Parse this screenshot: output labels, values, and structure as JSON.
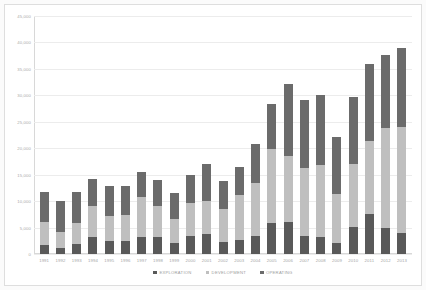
{
  "chart_data": {
    "type": "bar",
    "stacked": true,
    "title": "",
    "subtitle": "",
    "xlabel": "",
    "ylabel": "",
    "ylim": [
      0,
      45000
    ],
    "ytick_step": 5000,
    "ytick_labels": [
      "45,000",
      "40,000",
      "35,000",
      "30,000",
      "25,000",
      "20,000",
      "15,000",
      "10,000",
      "5,000",
      "0"
    ],
    "ytick_values": [
      45000,
      40000,
      35000,
      30000,
      25000,
      20000,
      15000,
      10000,
      5000,
      0
    ],
    "grid": true,
    "legend_position": "bottom",
    "categories": [
      "1991",
      "1992",
      "1993",
      "1994",
      "1995",
      "1996",
      "1997",
      "1998",
      "1999",
      "2000",
      "2001",
      "2002",
      "2003",
      "2004",
      "2005",
      "2006",
      "2007",
      "2008",
      "2009",
      "2010",
      "2011",
      "2012",
      "2013"
    ],
    "series": [
      {
        "name": "EXPLORATION",
        "color": "#595959",
        "values": [
          1700,
          1200,
          1900,
          3200,
          2400,
          2500,
          3300,
          3200,
          2100,
          3500,
          3700,
          2200,
          2700,
          3400,
          5800,
          6000,
          3500,
          3300,
          2100,
          5200,
          7500,
          5000,
          4000
        ]
      },
      {
        "name": "DEVELOPMENT",
        "color": "#bfbfbf",
        "values": [
          4300,
          2900,
          4000,
          5800,
          4700,
          4800,
          7400,
          5900,
          4500,
          6100,
          6400,
          6400,
          8500,
          10000,
          14000,
          12600,
          12700,
          13600,
          9300,
          11900,
          13800,
          18800,
          20000
        ]
      },
      {
        "name": "OPERATING",
        "color": "#6b6b6b",
        "values": [
          5800,
          6000,
          5900,
          5200,
          5800,
          5600,
          4900,
          4900,
          4900,
          5300,
          6900,
          5300,
          5300,
          7400,
          8500,
          13500,
          12900,
          13100,
          10800,
          12500,
          14700,
          13800,
          15000
        ]
      }
    ]
  },
  "legend": {
    "items": [
      {
        "label": "EXPLORATION",
        "color": "#595959"
      },
      {
        "label": "DEVELOPMENT",
        "color": "#bfbfbf"
      },
      {
        "label": "OPERATING",
        "color": "#6b6b6b"
      }
    ]
  }
}
